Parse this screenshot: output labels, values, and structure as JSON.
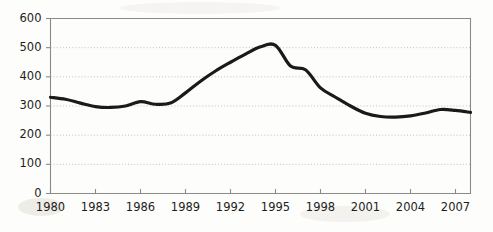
{
  "chart_data": {
    "type": "line",
    "title": "",
    "subtitle": "",
    "xlabel": "",
    "ylabel": "",
    "xlim": [
      1980,
      2008
    ],
    "ylim": [
      0,
      600
    ],
    "grid": true,
    "legend": false,
    "legend_position": "none",
    "y_ticks": [
      0,
      100,
      200,
      300,
      400,
      500,
      600
    ],
    "y_tick_labels": [
      "0",
      "100",
      "200",
      "300",
      "400",
      "500",
      "600"
    ],
    "x_ticks": [
      1980,
      1983,
      1986,
      1989,
      1992,
      1995,
      1998,
      2001,
      2004,
      2007
    ],
    "x_tick_labels": [
      "1980",
      "1983",
      "1986",
      "1989",
      "1992",
      "1995",
      "1998",
      "2001",
      "2004",
      "2007"
    ],
    "line_color": "#1a1a18",
    "line_width": 3.2,
    "grid_color": "#b9b9b4",
    "axis_color": "#8a8a86",
    "background_color": "#fdfdfc",
    "series": [
      {
        "name": "series-1",
        "x": [
          1980,
          1981,
          1982,
          1983,
          1984,
          1985,
          1986,
          1987,
          1988,
          1989,
          1990,
          1991,
          1992,
          1993,
          1994,
          1995,
          1996,
          1997,
          1998,
          1999,
          2000,
          2001,
          2002,
          2003,
          2004,
          2005,
          2006,
          2007,
          2008
        ],
        "values": [
          330,
          323,
          310,
          298,
          295,
          300,
          315,
          306,
          310,
          345,
          385,
          420,
          450,
          478,
          503,
          508,
          437,
          424,
          362,
          330,
          300,
          275,
          264,
          262,
          266,
          276,
          288,
          285,
          278
        ]
      }
    ]
  }
}
